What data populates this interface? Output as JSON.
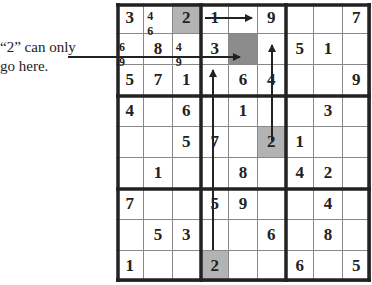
{
  "caption": {
    "line1": "“2” can only",
    "line2": "go here."
  },
  "grid": {
    "rows": [
      [
        "3",
        "",
        "2",
        "1",
        "",
        "9",
        "",
        "",
        "7"
      ],
      [
        "",
        "8",
        "",
        "3",
        "",
        "",
        "5",
        "1",
        ""
      ],
      [
        "5",
        "7",
        "1",
        "",
        "6",
        "4",
        "",
        "",
        "9"
      ],
      [
        "4",
        "",
        "6",
        "",
        "1",
        "",
        "",
        "3",
        ""
      ],
      [
        "",
        "",
        "5",
        "7",
        "",
        "2",
        "1",
        "",
        ""
      ],
      [
        "",
        "1",
        "",
        "",
        "8",
        "",
        "4",
        "2",
        ""
      ],
      [
        "7",
        "",
        "",
        "5",
        "9",
        "",
        "",
        "4",
        ""
      ],
      [
        "",
        "5",
        "3",
        "",
        "",
        "6",
        "",
        "8",
        ""
      ],
      [
        "1",
        "",
        "",
        "2",
        "",
        "",
        "6",
        "",
        "5"
      ]
    ],
    "candidates": {
      "0-1": "4 6",
      "1-0": "6 9",
      "1-2": "4 9"
    },
    "shaded_light": [
      "0-2",
      "4-5",
      "8-3"
    ],
    "shaded_dark": [
      "1-4"
    ]
  },
  "arrows": [
    {
      "name": "row1-arrow",
      "from": [
        205,
        18
      ],
      "to": [
        252,
        18
      ]
    },
    {
      "name": "caption-arrow",
      "from": [
        68,
        57
      ],
      "to": [
        240,
        57
      ]
    },
    {
      "name": "col5-arrow",
      "from": [
        272,
        141
      ],
      "to": [
        272,
        45
      ]
    },
    {
      "name": "col3-arrow",
      "from": [
        213,
        250
      ],
      "to": [
        213,
        70
      ]
    }
  ],
  "colors": {
    "light_shade": "#b3b3b3",
    "dark_shade": "#8c8c8c",
    "line": "#222222"
  }
}
